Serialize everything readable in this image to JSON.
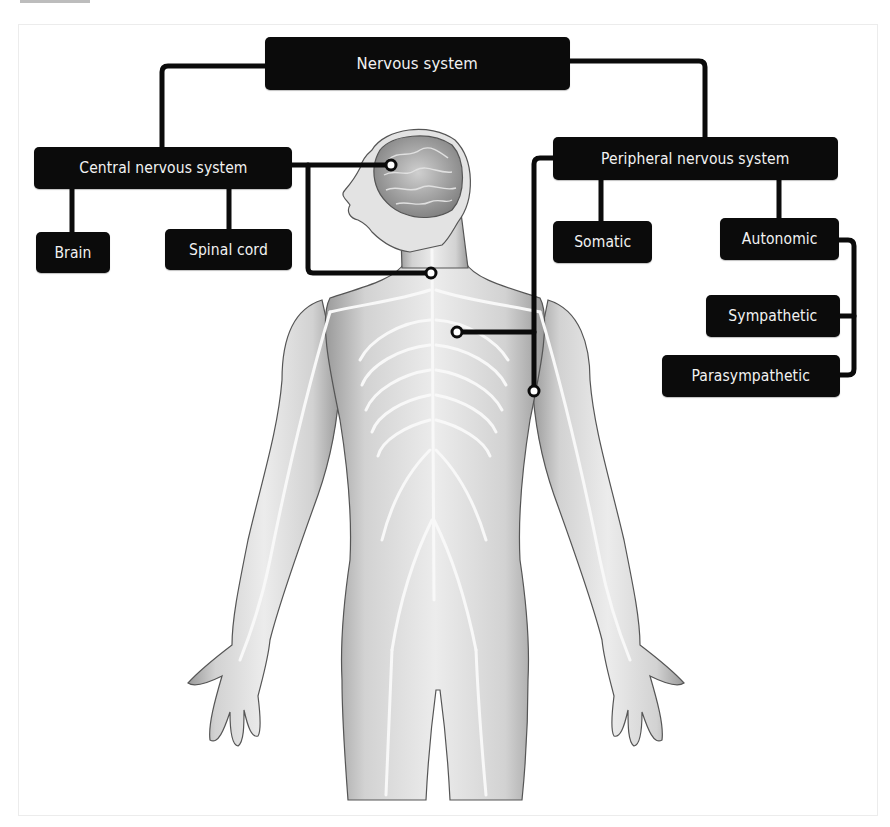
{
  "diagram": {
    "type": "hierarchy",
    "root": "Nervous system",
    "nodes": {
      "nervous_system": {
        "label": "Nervous system"
      },
      "central": {
        "label": "Central nervous system"
      },
      "brain": {
        "label": "Brain"
      },
      "spinal_cord": {
        "label": "Spinal cord"
      },
      "peripheral": {
        "label": "Peripheral nervous system"
      },
      "somatic": {
        "label": "Somatic"
      },
      "autonomic": {
        "label": "Autonomic"
      },
      "sympathetic": {
        "label": "Sympathetic"
      },
      "parasympathetic": {
        "label": "Parasympathetic"
      }
    },
    "edges": [
      {
        "from": "Nervous system",
        "to": "Central nervous system"
      },
      {
        "from": "Nervous system",
        "to": "Peripheral nervous system"
      },
      {
        "from": "Central nervous system",
        "to": "Brain"
      },
      {
        "from": "Central nervous system",
        "to": "Spinal cord"
      },
      {
        "from": "Peripheral nervous system",
        "to": "Somatic"
      },
      {
        "from": "Peripheral nervous system",
        "to": "Autonomic"
      },
      {
        "from": "Autonomic",
        "to": "Sympathetic"
      },
      {
        "from": "Autonomic",
        "to": "Parasympathetic"
      }
    ],
    "pointers": [
      {
        "from": "Central nervous system",
        "target": "brain (head)"
      },
      {
        "from": "Central nervous system",
        "target": "spinal cord (neck)"
      },
      {
        "from": "Peripheral nervous system",
        "target": "chest nerves"
      },
      {
        "from": "Peripheral nervous system",
        "target": "upper arm nerves"
      }
    ]
  },
  "illustration": {
    "subject": "human-body-nervous-system",
    "view": "anterior, head turned in profile"
  },
  "colors": {
    "box_fill": "#0b0b0b",
    "box_text": "#f2f2f2",
    "connector": "#0b0b0b",
    "background": "#ffffff",
    "body_shading": "#d8d8d8",
    "nerve_lines": "#f7f7f7"
  }
}
